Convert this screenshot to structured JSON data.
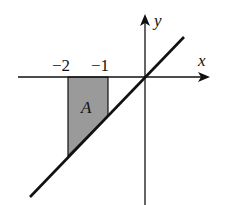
{
  "figure": {
    "x_axis_label": "x",
    "y_axis_label": "y",
    "tick_labels": [
      "−2",
      "−1"
    ],
    "region_label": "A"
  },
  "colors": {
    "axis": "#111111",
    "line": "#111111",
    "shade": "#9a9a9a"
  }
}
